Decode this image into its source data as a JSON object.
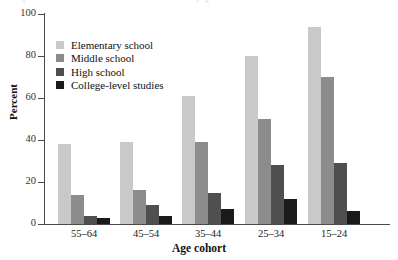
{
  "chart_data": {
    "type": "bar",
    "title": "",
    "xlabel": "Age cohort",
    "ylabel": "Percent",
    "ylim": [
      0,
      100
    ],
    "yticks": [
      0,
      20,
      40,
      60,
      80,
      100
    ],
    "grid": false,
    "legend_position": "upper-left-inside",
    "categories": [
      "55–64",
      "45–54",
      "35–44",
      "25–34",
      "15–24"
    ],
    "series": [
      {
        "name": "Elementary school",
        "color": "#c9c9c9",
        "values": [
          38,
          39,
          61,
          80,
          94
        ]
      },
      {
        "name": "Middle school",
        "color": "#8c8c8c",
        "values": [
          14,
          16,
          39,
          50,
          70
        ]
      },
      {
        "name": "High school",
        "color": "#4f4f4f",
        "values": [
          4,
          9,
          15,
          28,
          29
        ]
      },
      {
        "name": "College-level studies",
        "color": "#1a1a1a",
        "values": [
          3,
          4,
          7,
          12,
          6
        ]
      }
    ]
  },
  "axes": {
    "y_tick_labels": [
      "100",
      "80",
      "60",
      "40",
      "20",
      "0"
    ],
    "y_title": "Percent",
    "x_title": "Age cohort"
  },
  "top_remnant": {
    "left_fragment": "g",
    "right_fragment": "y g"
  }
}
